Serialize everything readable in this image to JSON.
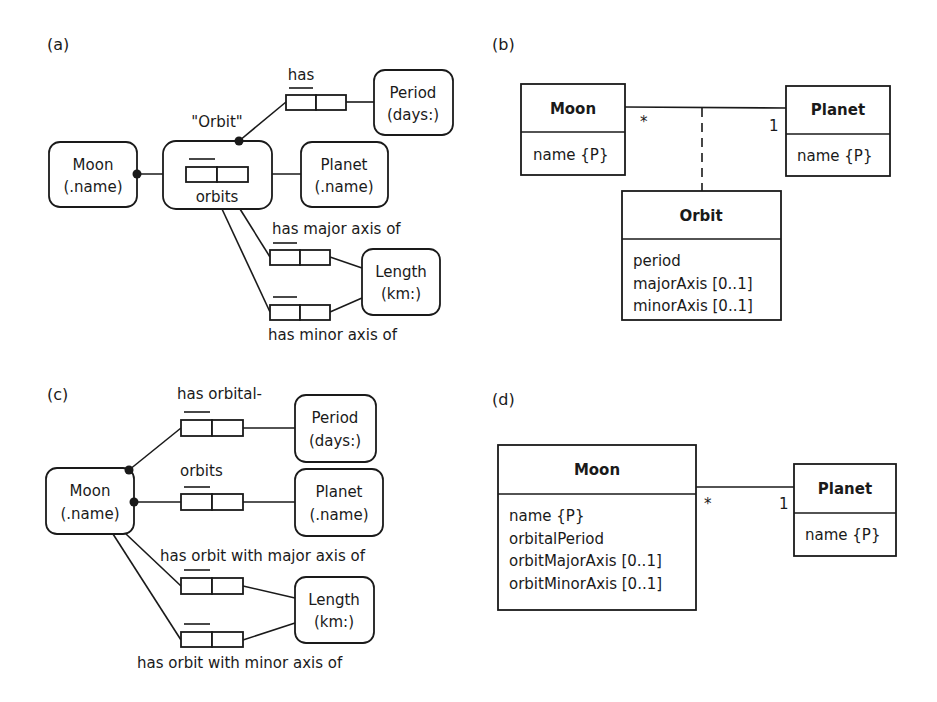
{
  "panels": {
    "a": {
      "label": "(a)",
      "entities": {
        "moon": {
          "line1": "Moon",
          "line2": "(.name)"
        },
        "planet": {
          "line1": "Planet",
          "line2": "(.name)"
        },
        "period": {
          "line1": "Period",
          "line2": "(days:)"
        },
        "length": {
          "line1": "Length",
          "line2": "(km:)"
        }
      },
      "objectified_name": "\"Orbit\"",
      "fact_types": {
        "orbits": "orbits",
        "has_period": "has",
        "major_axis": "has major axis of",
        "minor_axis": "has minor axis of"
      }
    },
    "b": {
      "label": "(b)",
      "classes": {
        "moon": {
          "name": "Moon",
          "attributes": [
            "name {P}"
          ]
        },
        "planet": {
          "name": "Planet",
          "attributes": [
            "name {P}"
          ]
        },
        "orbit": {
          "name": "Orbit",
          "attributes": [
            "period",
            "majorAxis [0..1]",
            "minorAxis [0..1]"
          ]
        }
      },
      "multiplicity": {
        "moon_end": "*",
        "planet_end": "1"
      }
    },
    "c": {
      "label": "(c)",
      "entities": {
        "moon": {
          "line1": "Moon",
          "line2": "(.name)"
        },
        "planet": {
          "line1": "Planet",
          "line2": "(.name)"
        },
        "period": {
          "line1": "Period",
          "line2": "(days:)"
        },
        "length": {
          "line1": "Length",
          "line2": "(km:)"
        }
      },
      "fact_types": {
        "period": "has orbital-",
        "orbits": "orbits",
        "major_axis": "has orbit with major axis of",
        "minor_axis": "has orbit with minor axis of"
      }
    },
    "d": {
      "label": "(d)",
      "classes": {
        "moon": {
          "name": "Moon",
          "attributes": [
            "name {P}",
            "orbitalPeriod",
            "orbitMajorAxis [0..1]",
            "orbitMinorAxis [0..1]"
          ]
        },
        "planet": {
          "name": "Planet",
          "attributes": [
            "name {P}"
          ]
        }
      },
      "multiplicity": {
        "moon_end": "*",
        "planet_end": "1"
      }
    }
  }
}
